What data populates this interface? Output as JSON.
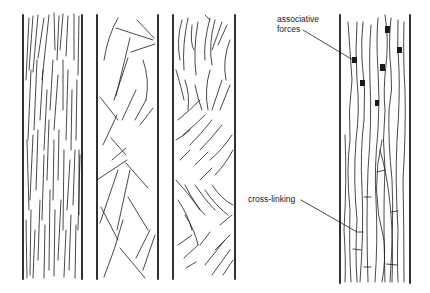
{
  "figure": {
    "panels": [
      {
        "id": "panel-1",
        "description": "aligned parallel fibres"
      },
      {
        "id": "panel-2",
        "description": "random oriented fibres"
      },
      {
        "id": "panel-3",
        "description": "wavy partially oriented fibres"
      },
      {
        "id": "panel-4",
        "description": "aligned fibres with associative forces and cross-linking"
      }
    ],
    "annotations": {
      "associative_forces_line1": "associative",
      "associative_forces_line2": "forces",
      "cross_linking": "cross-linking"
    },
    "colors": {
      "ink": "#1a1a1a",
      "background": "#ffffff"
    }
  }
}
